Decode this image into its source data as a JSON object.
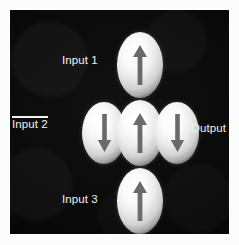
{
  "figure": {
    "panel_background": "#000000",
    "dot_fill": "#ffffff",
    "arrow_color": "#6a6a6a",
    "label_color": "#f2f2f2"
  },
  "labels": {
    "input1": "Input 1",
    "input2": "Input 2",
    "input2_inverted": true,
    "input3": "Input 3",
    "output": "Output"
  },
  "elements": [
    {
      "id": "top",
      "role": "input-1",
      "arrow": "up",
      "arrow_symbol": "↑"
    },
    {
      "id": "left",
      "role": "input-2",
      "arrow": "down",
      "arrow_symbol": "↓"
    },
    {
      "id": "center",
      "role": "majority-gate-center",
      "arrow": "up",
      "arrow_symbol": "↑"
    },
    {
      "id": "right",
      "role": "output",
      "arrow": "down",
      "arrow_symbol": "↓"
    },
    {
      "id": "bottom",
      "role": "input-3",
      "arrow": "up",
      "arrow_symbol": "↑"
    }
  ]
}
